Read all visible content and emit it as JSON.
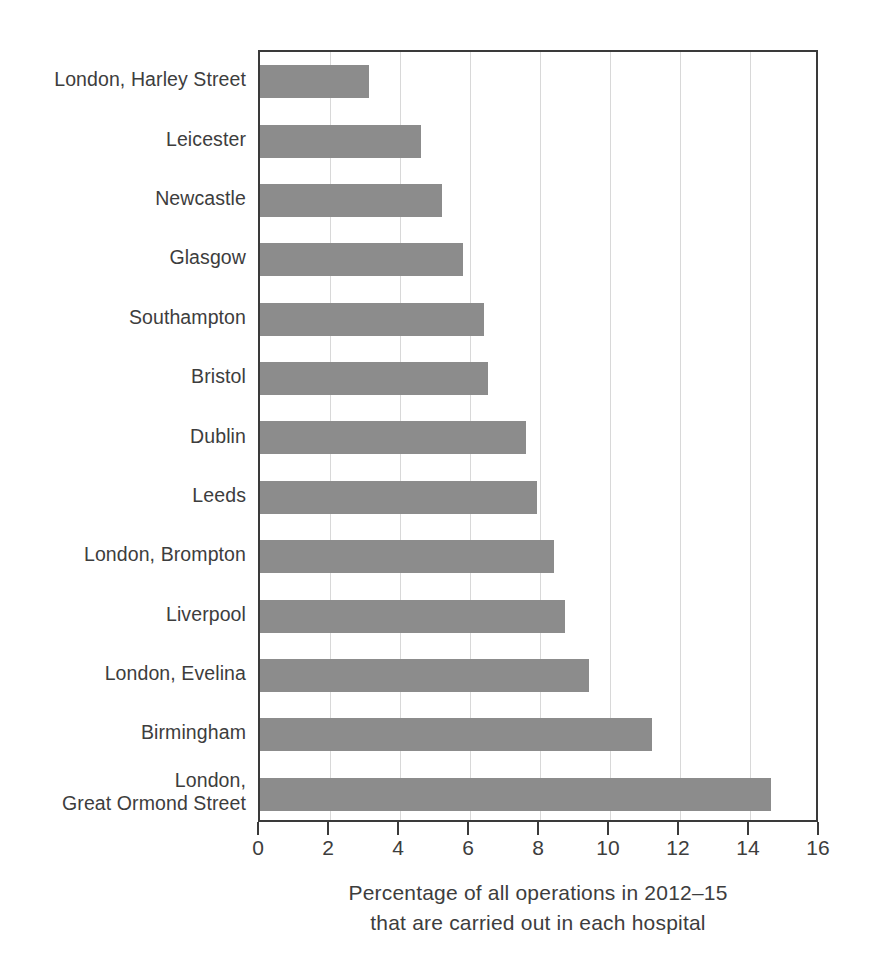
{
  "chart_data": {
    "type": "bar",
    "orientation": "horizontal",
    "title": "",
    "xlabel": "Percentage of all operations in 2012–15 that are carried out in each hospital",
    "ylabel": "",
    "xlim": [
      0,
      16
    ],
    "xticks": [
      0,
      2,
      4,
      6,
      8,
      10,
      12,
      14,
      16
    ],
    "xtick_labels": [
      "0",
      "2",
      "4",
      "6",
      "8",
      "10",
      "12",
      "14",
      "16"
    ],
    "grid": "vertical",
    "legend": "none",
    "bar_color": "#8c8c8c",
    "categories": [
      "London, Harley Street",
      "Leicester",
      "Newcastle",
      "Glasgow",
      "Southampton",
      "Bristol",
      "Dublin",
      "Leeds",
      "London, Brompton",
      "Liverpool",
      "London, Evelina",
      "Birmingham",
      "London,\nGreat Ormond Street"
    ],
    "values": [
      3.1,
      4.6,
      5.2,
      5.8,
      6.4,
      6.5,
      7.6,
      7.9,
      8.4,
      8.7,
      9.4,
      11.2,
      14.6
    ]
  },
  "caption": {
    "line1": "Percentage of all operations in 2012–15",
    "line2": "that are carried out in each hospital"
  }
}
